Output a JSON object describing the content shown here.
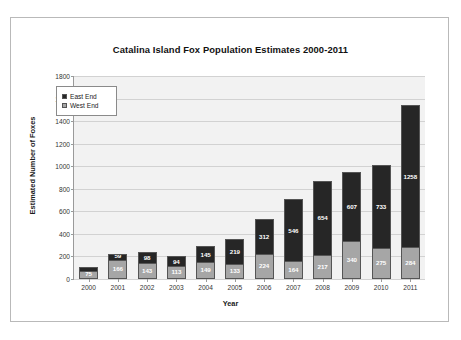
{
  "chart_data": {
    "type": "bar",
    "title": "Catalina Island Fox Population Estimates 2000-2011",
    "xlabel": "Year",
    "ylabel": "Estimated Number of Foxes",
    "ylim": [
      0,
      1800
    ],
    "ytick_step": 200,
    "yticks": [
      "0",
      "200",
      "400",
      "600",
      "800",
      "1000",
      "1200",
      "1400",
      "1600",
      "1800"
    ],
    "grid": true,
    "stacked": true,
    "legend_position": "inside-upper-left",
    "categories": [
      "2000",
      "2001",
      "2002",
      "2003",
      "2004",
      "2005",
      "2006",
      "2007",
      "2008",
      "2009",
      "2010",
      "2011"
    ],
    "series": [
      {
        "name": "East End",
        "color": "#262626",
        "values": [
          28,
          59,
          98,
          94,
          145,
          219,
          312,
          546,
          654,
          607,
          733,
          1258
        ]
      },
      {
        "name": "West End",
        "color": "#a6a6a6",
        "values": [
          75,
          166,
          143,
          113,
          149,
          133,
          224,
          164,
          217,
          340,
          275,
          284
        ]
      }
    ],
    "totals": [
      103,
      225,
      241,
      207,
      294,
      352,
      536,
      710,
      871,
      947,
      1008,
      1542
    ]
  }
}
